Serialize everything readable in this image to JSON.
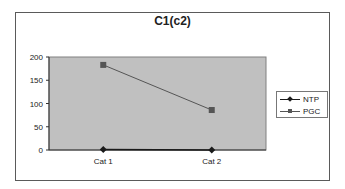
{
  "chart_data": {
    "type": "line",
    "title": "C1(c2)",
    "xlabel": "",
    "ylabel": "",
    "categories": [
      "Cat 1",
      "Cat 2"
    ],
    "series": [
      {
        "name": "NTP",
        "values": [
          1,
          0
        ],
        "color": "#1a1a1a",
        "marker": "diamond"
      },
      {
        "name": "PGC",
        "values": [
          183,
          86
        ],
        "color": "#555555",
        "marker": "square"
      }
    ],
    "ylim": [
      0,
      200
    ],
    "yticks": [
      0,
      50,
      100,
      150,
      200
    ],
    "grid": false,
    "legend_position": "right",
    "plot_background": "#c0c0c0"
  },
  "labels": {
    "title": "C1(c2)",
    "yticks": [
      "200",
      "150",
      "100",
      "50",
      "0"
    ],
    "xticks": [
      "Cat 1",
      "Cat 2"
    ],
    "legend": [
      "NTP",
      "PGC"
    ]
  }
}
